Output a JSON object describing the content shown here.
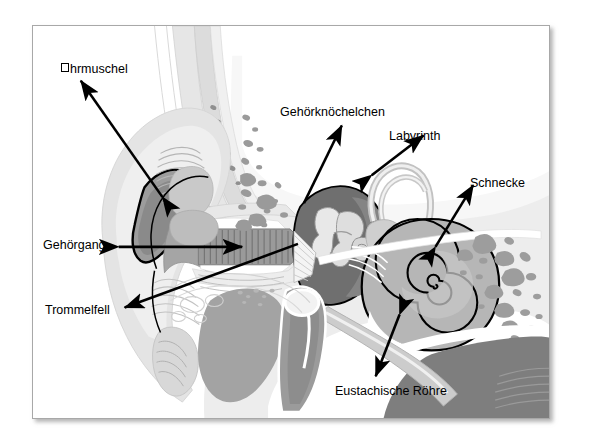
{
  "figure": {
    "language": "de",
    "frame": {
      "border_color": "#a8a8a8",
      "background_color": "#ffffff",
      "shadow": true
    },
    "palette": {
      "outline": "#000000",
      "tissue_lightest": "#f2f2f2",
      "tissue_light": "#e3e3e3",
      "tissue_mid": "#c9c9c9",
      "tissue_gray": "#a9a9a9",
      "tissue_dark": "#8a8a8a",
      "cavity_dark": "#6f6f6f",
      "bone_white": "#ffffff",
      "arrow_color": "#000000"
    },
    "labels": [
      {
        "id": "ohrmuschel",
        "text": "hrmuschel",
        "has_missing_glyph": true,
        "x": 60,
        "y": 62,
        "arrow": "double",
        "points_to": "outer-ear-pinna"
      },
      {
        "id": "gehoerknoechelchen",
        "text": "Gehörknöchelchen",
        "has_missing_glyph": false,
        "x": 279,
        "y": 105,
        "arrow": "single",
        "points_to": "ossicles"
      },
      {
        "id": "labyrinth",
        "text": "Labyrinth",
        "has_missing_glyph": false,
        "x": 388,
        "y": 129,
        "arrow": "double",
        "points_to": "semicircular-canals"
      },
      {
        "id": "schnecke",
        "text": "Schnecke",
        "has_missing_glyph": false,
        "x": 469,
        "y": 176,
        "arrow": "double",
        "points_to": "cochlea"
      },
      {
        "id": "gehoergang",
        "text": "Gehörgang",
        "has_missing_glyph": false,
        "x": 42,
        "y": 238,
        "arrow": "double",
        "points_to": "ear-canal"
      },
      {
        "id": "trommelfell",
        "text": "Trommelfell",
        "has_missing_glyph": false,
        "x": 44,
        "y": 303,
        "arrow": "single",
        "points_to": "eardrum"
      },
      {
        "id": "eustachische-roehre",
        "text": "Eustachische Röhre",
        "has_missing_glyph": false,
        "x": 334,
        "y": 384,
        "arrow": "double",
        "points_to": "eustachian-tube"
      }
    ],
    "structures": [
      {
        "id": "outer-ear-pinna",
        "name": "Ohrmuschel"
      },
      {
        "id": "ear-canal",
        "name": "Gehörgang"
      },
      {
        "id": "eardrum",
        "name": "Trommelfell"
      },
      {
        "id": "ossicles",
        "name": "Gehörknöchelchen"
      },
      {
        "id": "semicircular-canals",
        "name": "Labyrinth"
      },
      {
        "id": "cochlea",
        "name": "Schnecke"
      },
      {
        "id": "eustachian-tube",
        "name": "Eustachische Röhre"
      },
      {
        "id": "mastoid-air-cells",
        "name": "Mastoidzellen"
      },
      {
        "id": "mandible",
        "name": "Unterkiefer"
      },
      {
        "id": "skull-bone",
        "name": "Schädelknochen"
      }
    ]
  }
}
